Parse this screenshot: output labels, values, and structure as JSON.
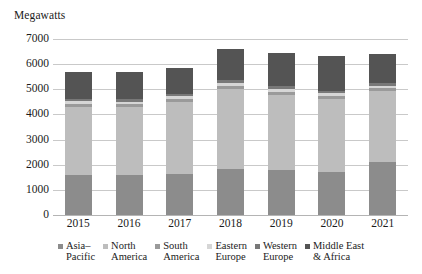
{
  "chart_data": {
    "type": "bar",
    "subtype": "stacked-bar",
    "title": "",
    "ylabel": "Megawatts",
    "xlabel": "",
    "ylim": [
      0,
      7000
    ],
    "ytick_step": 1000,
    "yticks": [
      "7000",
      "6000",
      "5000",
      "4000",
      "3000",
      "2000",
      "1000",
      "0"
    ],
    "grid": true,
    "legend_position": "bottom",
    "categories": [
      "2015",
      "2016",
      "2017",
      "2018",
      "2019",
      "2020",
      "2021"
    ],
    "series": [
      {
        "name": "Asia–Pacific",
        "legend_line1": "Asia–",
        "legend_line2": "Pacific",
        "color": "#8c8c8c",
        "values": [
          1600,
          1600,
          1650,
          1820,
          1800,
          1700,
          2120
        ]
      },
      {
        "name": "North America",
        "legend_line1": "North",
        "legend_line2": "America",
        "color": "#bdbdbd",
        "values": [
          2700,
          2700,
          2850,
          3180,
          2980,
          2900,
          2800
        ]
      },
      {
        "name": "South America",
        "legend_line1": "South",
        "legend_line2": "America",
        "color": "#9a9a9a",
        "values": [
          120,
          110,
          120,
          130,
          130,
          130,
          120
        ]
      },
      {
        "name": "Eastern Europe",
        "legend_line1": "Eastern",
        "legend_line2": "Europe",
        "color": "#d6d6d6",
        "values": [
          100,
          100,
          110,
          120,
          120,
          110,
          110
        ]
      },
      {
        "name": "Western Europe",
        "legend_line1": "Western",
        "legend_line2": "Europe",
        "color": "#787878",
        "values": [
          80,
          90,
          100,
          110,
          110,
          100,
          100
        ]
      },
      {
        "name": "Middle East & Africa",
        "legend_line1": "Middle East",
        "legend_line2": "& Africa",
        "color": "#545454",
        "values": [
          1100,
          1100,
          1000,
          1260,
          1300,
          1390,
          1150
        ]
      }
    ],
    "totals": [
      5700,
      5700,
      5830,
      6620,
      6440,
      6330,
      6400
    ]
  }
}
